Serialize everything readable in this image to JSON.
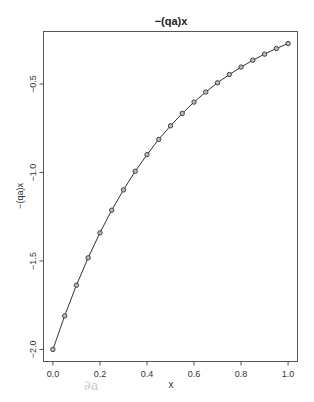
{
  "chart_data": {
    "type": "line",
    "title": "−(qa)x",
    "xlabel": "x",
    "ylabel": "−(qa)x",
    "x": [
      0.0,
      0.05,
      0.1,
      0.15,
      0.2,
      0.25,
      0.3,
      0.35,
      0.4,
      0.45,
      0.5,
      0.55,
      0.6,
      0.65,
      0.7,
      0.75,
      0.8,
      0.85,
      0.9,
      0.95,
      1.0
    ],
    "series": [
      {
        "name": "−(qa)x",
        "values": [
          -2.0,
          -1.81,
          -1.637,
          -1.482,
          -1.341,
          -1.213,
          -1.098,
          -0.993,
          -0.899,
          -0.813,
          -0.736,
          -0.666,
          -0.602,
          -0.545,
          -0.493,
          -0.446,
          -0.404,
          -0.365,
          -0.331,
          -0.299,
          -0.271
        ],
        "marker": "circle",
        "line": true,
        "color": "#333333"
      }
    ],
    "xticks": [
      0.0,
      0.2,
      0.4,
      0.6,
      0.8,
      1.0
    ],
    "xtick_labels": [
      "0.0",
      "0.2",
      "0.4",
      "0.6",
      "0.8",
      "1.0"
    ],
    "yticks": [
      -2.0,
      -1.5,
      -1.0,
      -0.5
    ],
    "ytick_labels": [
      "−2.0",
      "−1.5",
      "−1.0",
      "−0.5"
    ],
    "xlim": [
      -0.04,
      1.04
    ],
    "ylim": [
      -2.068,
      -0.203
    ],
    "grid": false,
    "legend": null
  },
  "artifact_text": "∂a"
}
